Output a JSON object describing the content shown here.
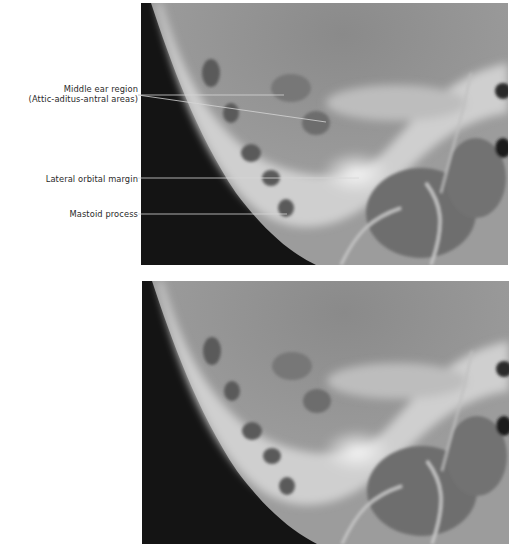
{
  "figure": {
    "top_panel": {
      "type": "radiograph",
      "labels": [
        {
          "id": "middle-ear",
          "line1": "Middle ear region",
          "line2": "(Attic-aditus-antral areas)"
        },
        {
          "id": "lateral-orbital",
          "line1": "Lateral orbital margin"
        },
        {
          "id": "mastoid",
          "line1": "Mastoid process"
        }
      ]
    },
    "bottom_panel": {
      "type": "radiograph",
      "labels": []
    }
  },
  "colors": {
    "background": "#ffffff",
    "label_text": "#2a2a2a",
    "leader_line": "#d8d8d8"
  }
}
